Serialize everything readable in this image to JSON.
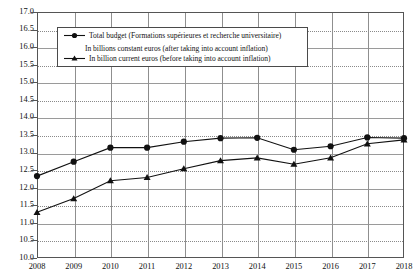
{
  "chart_data": {
    "type": "line",
    "title": "",
    "xlabel": "",
    "ylabel": "",
    "x": [
      2008,
      2009,
      2010,
      2011,
      2012,
      2013,
      2014,
      2015,
      2016,
      2017,
      2018
    ],
    "categories": [
      "2008",
      "2009",
      "2010",
      "2011",
      "2012",
      "2013",
      "2014",
      "2015",
      "2016",
      "2017",
      "2018"
    ],
    "ylim": [
      10.0,
      17.0
    ],
    "ytick_labels": [
      "10.0",
      "10.5",
      "11.0",
      "11.5",
      "12.0",
      "12.5",
      "13.0",
      "13.5",
      "14.0",
      "14.5",
      "15.0",
      "15.5",
      "16.0",
      "16.5",
      "17.0"
    ],
    "ytick_values": [
      10.0,
      10.5,
      11.0,
      11.5,
      12.0,
      12.5,
      13.0,
      13.5,
      14.0,
      14.5,
      15.0,
      15.5,
      16.0,
      16.5,
      17.0
    ],
    "grid": true,
    "legend_position": "upper-left-inside",
    "series": [
      {
        "name": "Total budget (Formations supérieures et recherche universitaire) In billions constant euros (after taking into account inflation)",
        "legend_line_1": "Total budget (Formations supérieures et recherche universitaire)",
        "legend_line_2": "In billions constant euros (after taking into account inflation)",
        "marker": "circle",
        "color": "#111111",
        "values": [
          12.33,
          12.74,
          13.14,
          13.14,
          13.31,
          13.41,
          13.42,
          13.08,
          13.18,
          13.43,
          13.41
        ]
      },
      {
        "name": "In billion current euros (before taking into account inflation)",
        "legend_line_1": "In billion current euros (before taking into account inflation)",
        "legend_line_2": "",
        "marker": "triangle",
        "color": "#111111",
        "values": [
          11.3,
          11.69,
          12.2,
          12.29,
          12.54,
          12.77,
          12.85,
          12.67,
          12.85,
          13.25,
          13.36
        ]
      }
    ]
  },
  "axes": {
    "y_labels": [
      "17.0",
      "16.5",
      "16.0",
      "15.5",
      "15.0",
      "14.5",
      "14.0",
      "13.5",
      "13.0",
      "12.5",
      "12.0",
      "11.5",
      "11.0",
      "10.5",
      "10.0"
    ],
    "x_labels": [
      "2008",
      "2009",
      "2010",
      "2011",
      "2012",
      "2013",
      "2014",
      "2015",
      "2016",
      "2017",
      "2018"
    ]
  },
  "legend": {
    "entry_1_line_1": "Total budget (Formations supérieures et recherche universitaire)",
    "entry_1_line_2": "In billions constant euros (after taking into account inflation)",
    "entry_2_line_1": "In billion current euros (before taking into account inflation)"
  },
  "colors": {
    "series": "#111111",
    "grid": "#8a8a8a",
    "frame": "#555555",
    "background": "#ffffff"
  }
}
